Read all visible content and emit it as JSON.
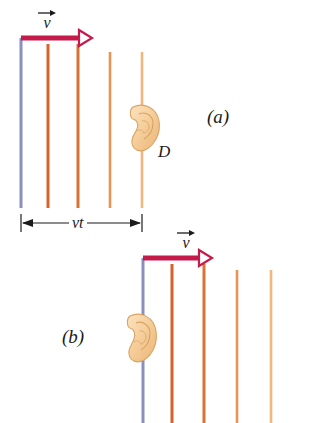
{
  "figure": {
    "background_color": "#ffffff",
    "width": 329,
    "height": 423
  },
  "colors": {
    "wavefront_source": "#8a8fc0",
    "wavefront_1": "#d4622a",
    "wavefront_2": "#da7236",
    "wavefront_3": "#e79455",
    "wavefront_4": "#f0b67f",
    "velocity_arrow": "#c41b4a",
    "ear_fill": "#f5cd98",
    "ear_outline": "#d9a463",
    "text": "#1b1b1b",
    "dimension_line": "#1b1b1b"
  },
  "panels": [
    {
      "id": "a",
      "label": "(a)",
      "label_x": 207,
      "label_y": 107,
      "velocity_vector": {
        "symbol": "v",
        "arrow_label_x": 36,
        "arrow_label_y": 8,
        "shaft_y": 38,
        "shaft_x_start": 21,
        "shaft_x_end": 80,
        "tip_x": 92
      },
      "wavefronts": [
        {
          "name": "source-wavefront",
          "x": 21,
          "y_top": 38,
          "y_bottom": 208,
          "color_key": "wavefront_source",
          "width": 3.0
        },
        {
          "name": "wavefront-1",
          "x": 48,
          "y_top": 44,
          "y_bottom": 208,
          "color_key": "wavefront_1",
          "width": 3.0
        },
        {
          "name": "wavefront-2",
          "x": 78,
          "y_top": 44,
          "y_bottom": 208,
          "color_key": "wavefront_2",
          "width": 3.0
        },
        {
          "name": "wavefront-3",
          "x": 110,
          "y_top": 52,
          "y_bottom": 208,
          "color_key": "wavefront_3",
          "width": 2.6
        },
        {
          "name": "wavefront-4",
          "x": 142,
          "y_top": 52,
          "y_bottom": 208,
          "color_key": "wavefront_4",
          "width": 2.6
        }
      ],
      "detector": {
        "label": "D",
        "label_x": 158,
        "label_y": 143,
        "ear_cx": 146,
        "ear_cy": 127,
        "ear_w": 30,
        "ear_h": 46
      }
    },
    {
      "id": "b",
      "label": "(b)",
      "label_x": 62,
      "label_y": 327,
      "velocity_vector": {
        "symbol": "v",
        "arrow_label_x": 175,
        "arrow_label_y": 228,
        "shaft_y": 258,
        "shaft_x_start": 143,
        "shaft_x_end": 200,
        "tip_x": 212
      },
      "wavefronts": [
        {
          "name": "source-wavefront",
          "x": 143,
          "y_top": 258,
          "y_bottom": 423,
          "color_key": "wavefront_source",
          "width": 3.0
        },
        {
          "name": "wavefront-1",
          "x": 172,
          "y_top": 264,
          "y_bottom": 423,
          "color_key": "wavefront_1",
          "width": 3.0
        },
        {
          "name": "wavefront-2",
          "x": 204,
          "y_top": 264,
          "y_bottom": 423,
          "color_key": "wavefront_2",
          "width": 3.0
        },
        {
          "name": "wavefront-3",
          "x": 237,
          "y_top": 270,
          "y_bottom": 423,
          "color_key": "wavefront_3",
          "width": 2.6
        },
        {
          "name": "wavefront-4",
          "x": 271,
          "y_top": 270,
          "y_bottom": 423,
          "color_key": "wavefront_4",
          "width": 2.6
        }
      ],
      "detector": {
        "label": "",
        "label_x": 0,
        "label_y": 0,
        "ear_cx": 143,
        "ear_cy": 337,
        "ear_w": 30,
        "ear_h": 48
      }
    }
  ],
  "dimension": {
    "name": "vt",
    "label": "vt",
    "label_x": 69,
    "label_y": 214,
    "y": 223,
    "x_start": 21,
    "x_end": 142,
    "tick_half_height": 9
  }
}
